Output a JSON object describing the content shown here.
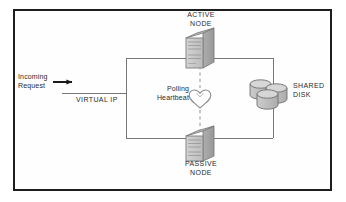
{
  "diagram": {
    "type": "network-cluster-architecture",
    "border_color": "#1e1e1e",
    "background_color": "#ffffff",
    "line_color": "#6e6e6e",
    "text_color": "#2b2b2b",
    "node_fill_front": "#c9c9c9",
    "node_fill_side": "#a3a3a3",
    "node_stroke": "#7a7a7a",
    "disk_fill": "#bdbdbd",
    "disk_top_fill": "#d2d2d2",
    "disk_stroke": "#6f6f6f",
    "labels": {
      "active_node": "ACTIVE\nNODE",
      "passive_node": "PASSIVE\nNODE",
      "incoming_request": "Incoming\nRequest",
      "virtual_ip": "VIRTUAL IP",
      "polling_heartbeat": "Polling\nHeartbeat",
      "shared_disk": "SHARED\nDISK"
    },
    "icons": {
      "active_node": "server-tower-icon",
      "passive_node": "server-tower-icon",
      "shared_disk": "disk-stack-icon",
      "heartbeat": "heart-icon",
      "incoming_arrow": "arrow-right-icon"
    },
    "connections": [
      {
        "from": "incoming-request",
        "to": "virtual-ip",
        "style": "solid-arrow"
      },
      {
        "from": "virtual-ip",
        "to": "active-node",
        "style": "solid"
      },
      {
        "from": "virtual-ip",
        "to": "passive-node",
        "style": "solid"
      },
      {
        "from": "active-node",
        "to": "shared-disk",
        "style": "solid"
      },
      {
        "from": "passive-node",
        "to": "shared-disk",
        "style": "solid"
      },
      {
        "from": "active-node",
        "to": "passive-node",
        "style": "dashed-heartbeat"
      }
    ]
  }
}
